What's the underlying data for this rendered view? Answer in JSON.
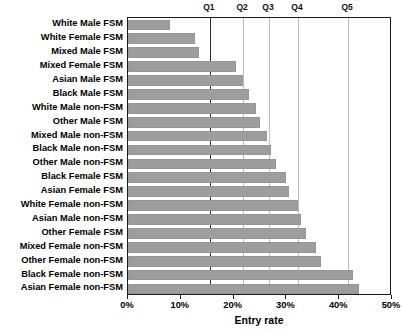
{
  "chart_data": {
    "type": "bar",
    "orientation": "horizontal",
    "title": "",
    "xlabel": "Entry rate",
    "ylabel": "",
    "xlim": [
      0,
      50
    ],
    "xunit": "%",
    "grid": false,
    "legend": null,
    "xticks": [
      "0%",
      "10%",
      "20%",
      "30%",
      "40%",
      "50%"
    ],
    "xtickvalues": [
      0,
      10,
      20,
      30,
      40,
      50
    ],
    "bar_color": "#9d9d9d",
    "categories": [
      "White Male FSM",
      "White Female FSM",
      "Mixed Male FSM",
      "Mixed Female FSM",
      "Asian Male FSM",
      "Black Male FSM",
      "White Male non-FSM",
      "Other Male FSM",
      "Mixed Male non-FSM",
      "Black Male non-FSM",
      "Other Male non-FSM",
      "Black Female FSM",
      "Asian Female FSM",
      "White Female non-FSM",
      "Asian Male non-FSM",
      "Other Female FSM",
      "Mixed Female non-FSM",
      "Other Female non-FSM",
      "Black Female non-FSM",
      "Asian Female non-FSM"
    ],
    "values": [
      7.9,
      12.7,
      13.4,
      20.5,
      21.8,
      22.9,
      24.2,
      25.0,
      26.3,
      27.1,
      28.0,
      29.9,
      30.5,
      32.2,
      32.8,
      33.7,
      35.6,
      36.6,
      42.6,
      43.7
    ],
    "annotations": {
      "quartile_lines": [
        {
          "label": "Q1",
          "value": 15.5,
          "style": "dark"
        },
        {
          "label": "Q2",
          "value": 21.8,
          "style": "light"
        },
        {
          "label": "Q3",
          "value": 26.7,
          "style": "light"
        },
        {
          "label": "Q4",
          "value": 32.2,
          "style": "light"
        },
        {
          "label": "Q5",
          "value": 41.7,
          "style": "light"
        }
      ]
    }
  }
}
